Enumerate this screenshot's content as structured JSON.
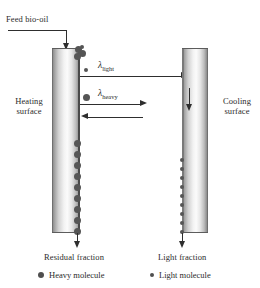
{
  "figure": {
    "feed_label": "Feed bio-oil",
    "heating_surface_label": "Heating surface",
    "cooling_surface_label": "Cooling surface",
    "residual_label": "Residual fraction",
    "light_fraction_label": "Light fraction",
    "lambda_light": "λ",
    "lambda_light_sub": "light",
    "lambda_heavy": "λ",
    "lambda_heavy_sub": "heavy",
    "legend": [
      {
        "marker": "heavy-molecule-dot",
        "label": "Heavy molecule",
        "size": "big"
      },
      {
        "marker": "light-molecule-dot",
        "label": "Light molecule",
        "size": "small"
      }
    ],
    "colors": {
      "line": "#2e2e2e",
      "molecule": "#4f4f4f",
      "tube_wall": "#6f6f6f",
      "text": "#2b2b2b",
      "background": "#ffffff"
    },
    "heating_tube_molecules": 9,
    "cooling_tube_molecules": 9,
    "arrows": [
      {
        "name": "feed-inlet-arrow",
        "direction": "down"
      },
      {
        "name": "lambda-light-path-arrow",
        "direction": "right"
      },
      {
        "name": "lambda-heavy-path-arrow",
        "direction": "right"
      },
      {
        "name": "heavy-return-arrow",
        "direction": "left"
      },
      {
        "name": "cooling-inlet-arrow",
        "direction": "right"
      },
      {
        "name": "cooling-downflow-arrow",
        "direction": "down"
      },
      {
        "name": "residual-outlet-arrow",
        "direction": "down"
      },
      {
        "name": "light-fraction-outlet-arrow",
        "direction": "down"
      }
    ]
  }
}
